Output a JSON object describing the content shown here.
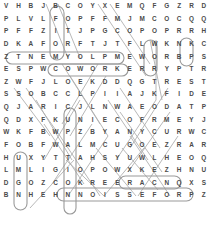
{
  "puzzle": {
    "type": "word-search",
    "rows": 16,
    "cols": 17,
    "grid": [
      [
        "V",
        "H",
        "B",
        "J",
        "B",
        "C",
        "O",
        "Y",
        "X",
        "E",
        "M",
        "Q",
        "F",
        "G",
        "Z",
        "R",
        "D"
      ],
      [
        "P",
        "L",
        "V",
        "L",
        "F",
        "O",
        "P",
        "F",
        "F",
        "M",
        "J",
        "M",
        "C",
        "O",
        "C",
        "Q",
        "Q"
      ],
      [
        "P",
        "F",
        "F",
        "Z",
        "I",
        "T",
        "J",
        "P",
        "G",
        "C",
        "O",
        "P",
        "O",
        "P",
        "R",
        "R",
        "H"
      ],
      [
        "D",
        "K",
        "A",
        "F",
        "O",
        "R",
        "F",
        "T",
        "J",
        "T",
        "F",
        "L",
        "W",
        "K",
        "N",
        "K",
        "C"
      ],
      [
        "Z",
        "T",
        "N",
        "E",
        "M",
        "Y",
        "O",
        "L",
        "P",
        "M",
        "E",
        "W",
        "O",
        "R",
        "B",
        "P",
        "S"
      ],
      [
        "E",
        "S",
        "P",
        "W",
        "C",
        "O",
        "W",
        "O",
        "R",
        "K",
        "E",
        "R",
        "R",
        "Y",
        "P",
        "T",
        "R"
      ],
      [
        "Z",
        "W",
        "F",
        "J",
        "L",
        "O",
        "E",
        "K",
        "D",
        "D",
        "Q",
        "G",
        "T",
        "R",
        "E",
        "S",
        "T"
      ],
      [
        "S",
        "S",
        "O",
        "B",
        "C",
        "C",
        "L",
        "P",
        "I",
        "I",
        "A",
        "J",
        "K",
        "F",
        "I",
        "D",
        "E"
      ],
      [
        "Q",
        "J",
        "A",
        "R",
        "I",
        "C",
        "J",
        "L",
        "N",
        "W",
        "A",
        "E",
        "O",
        "D",
        "A",
        "T",
        "P"
      ],
      [
        "Q",
        "D",
        "X",
        "F",
        "K",
        "U",
        "N",
        "I",
        "E",
        "C",
        "O",
        "F",
        "R",
        "M",
        "E",
        "Y",
        "J"
      ],
      [
        "W",
        "K",
        "F",
        "B",
        "W",
        "P",
        "Z",
        "B",
        "Y",
        "A",
        "N",
        "Y",
        "C",
        "U",
        "R",
        "W",
        "C"
      ],
      [
        "F",
        "O",
        "B",
        "F",
        "W",
        "A",
        "L",
        "M",
        "C",
        "U",
        "G",
        "O",
        "E",
        "Z",
        "R",
        "A",
        "R"
      ],
      [
        "H",
        "U",
        "X",
        "Y",
        "T",
        "T",
        "A",
        "H",
        "S",
        "Y",
        "U",
        "W",
        "L",
        "H",
        "E",
        "O",
        "Q"
      ],
      [
        "L",
        "M",
        "L",
        "I",
        "G",
        "I",
        "O",
        "P",
        "O",
        "W",
        "X",
        "K",
        "E",
        "Z",
        "H",
        "N",
        "U"
      ],
      [
        "D",
        "G",
        "O",
        "Z",
        "C",
        "O",
        "K",
        "R",
        "E",
        "E",
        "R",
        "A",
        "C",
        "N",
        "Q",
        "X",
        "S"
      ],
      [
        "B",
        "N",
        "H",
        "E",
        "H",
        "N",
        "N",
        "O",
        "I",
        "S",
        "S",
        "E",
        "F",
        "O",
        "R",
        "P",
        "Z"
      ]
    ],
    "found_words": [
      "EMPLOYMENT",
      "BROWE",
      "COWORKER",
      "CAREER",
      "PROFESSION"
    ],
    "colors": {
      "letter": "#4a4a4a",
      "mark": "#9a9a9a",
      "background": "#ffffff"
    }
  }
}
